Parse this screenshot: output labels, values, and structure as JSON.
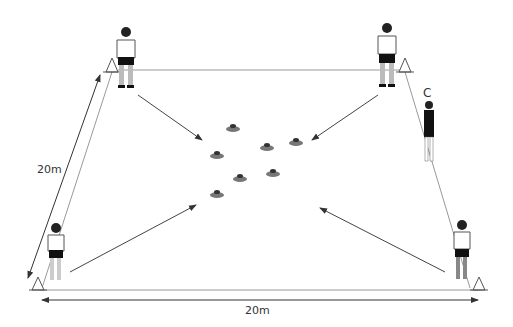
{
  "diagram": {
    "type": "rugby-drill-grid",
    "labels": {
      "side_width": "20m",
      "side_length": "20m",
      "coach": "C"
    },
    "pitch": {
      "corners": {
        "tl": [
          112,
          70
        ],
        "tr": [
          405,
          70
        ],
        "bl": [
          33,
          290
        ],
        "br": [
          483,
          290
        ]
      },
      "line_color": "#888888"
    },
    "players": [
      {
        "id": "player-top-left",
        "x": 125,
        "y": 20,
        "shirt": "#ffffff"
      },
      {
        "id": "player-top-right",
        "x": 387,
        "y": 20,
        "shirt": "#ffffff"
      },
      {
        "id": "player-bottom-left",
        "x": 56,
        "y": 222,
        "shirt": "#ffffff"
      },
      {
        "id": "player-bottom-right",
        "x": 462,
        "y": 222,
        "shirt": "#ffffff"
      },
      {
        "id": "coach",
        "x": 429,
        "y": 100,
        "shirt": "#111111"
      }
    ],
    "cones": [
      {
        "x": 112,
        "y": 65
      },
      {
        "x": 405,
        "y": 65
      },
      {
        "x": 38,
        "y": 285
      },
      {
        "x": 478,
        "y": 285
      }
    ],
    "discs": [
      {
        "x": 233,
        "y": 128
      },
      {
        "x": 296,
        "y": 142
      },
      {
        "x": 267,
        "y": 147
      },
      {
        "x": 217,
        "y": 155
      },
      {
        "x": 273,
        "y": 173
      },
      {
        "x": 240,
        "y": 178
      },
      {
        "x": 217,
        "y": 194
      }
    ],
    "arrows": [
      {
        "from": [
          138,
          95
        ],
        "to": [
          202,
          140
        ]
      },
      {
        "from": [
          378,
          95
        ],
        "to": [
          312,
          140
        ]
      },
      {
        "from": [
          70,
          272
        ],
        "to": [
          196,
          205
        ]
      },
      {
        "from": [
          445,
          272
        ],
        "to": [
          320,
          208
        ]
      }
    ]
  }
}
